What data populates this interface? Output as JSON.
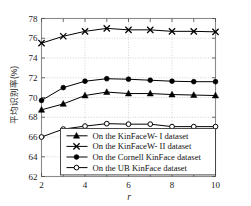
{
  "chart_data": {
    "type": "line",
    "title": "",
    "xlabel": "r",
    "ylabel": "平均识别率(%)",
    "x": [
      2,
      3,
      4,
      5,
      6,
      7,
      8,
      9,
      10
    ],
    "xlim": [
      2,
      10
    ],
    "ylim": [
      62,
      78
    ],
    "xticks": [
      "2",
      "4",
      "6",
      "8",
      "10"
    ],
    "xtick_values": [
      2,
      4,
      6,
      8,
      10
    ],
    "yticks": [
      "62",
      "64",
      "66",
      "68",
      "70",
      "72",
      "74",
      "76",
      "78"
    ],
    "ytick_values": [
      62,
      64,
      66,
      68,
      70,
      72,
      74,
      76,
      78
    ],
    "grid": true,
    "grid_style": "dotted",
    "legend_position": "lower center",
    "series": [
      {
        "name": "On the KinFaceW- I dataset",
        "marker": "filled-triangle",
        "color": "#000000",
        "values": [
          68.75,
          69.35,
          70.2,
          70.55,
          70.4,
          70.4,
          70.3,
          70.25,
          70.2
        ]
      },
      {
        "name": "On the KinFaceW- II dataset",
        "marker": "cross-x",
        "color": "#000000",
        "values": [
          75.5,
          76.2,
          76.7,
          77.0,
          76.85,
          76.85,
          76.7,
          76.7,
          76.65
        ]
      },
      {
        "name": "On the Cornell KinFace dataset",
        "marker": "filled-circle",
        "color": "#000000",
        "values": [
          69.7,
          71.0,
          71.65,
          71.9,
          71.85,
          71.75,
          71.65,
          71.6,
          71.6
        ]
      },
      {
        "name": "On the UB KinFace dataset",
        "marker": "open-circle",
        "color": "#000000",
        "values": [
          66.0,
          66.8,
          67.1,
          67.35,
          67.3,
          67.3,
          67.05,
          67.05,
          67.05
        ]
      }
    ]
  },
  "axes": {
    "y_label_text": "平均识别率(%)",
    "x_label_text": "r"
  },
  "legend": {
    "entries": [
      {
        "label": "On the KinFaceW- I dataset",
        "marker": "filled-triangle"
      },
      {
        "label": "On the KinFaceW- II dataset",
        "marker": "cross-x"
      },
      {
        "label": "On the Cornell KinFace dataset",
        "marker": "filled-circle"
      },
      {
        "label": "On the UB KinFace dataset",
        "marker": "open-circle"
      }
    ]
  },
  "style": {
    "frame_color": "#8a8a8a",
    "line_color": "#1a1a1a",
    "grid_color": "#b5b5b5",
    "background": "#ffffff"
  }
}
